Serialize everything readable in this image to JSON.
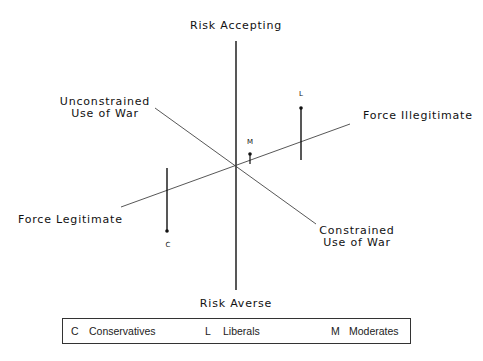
{
  "diagram": {
    "axes": {
      "vertical": {
        "top_label": "Risk Accepting",
        "bottom_label": "Risk Averse"
      },
      "diagonal_shallow": {
        "left_label": "Force Legitimate",
        "right_label": "Force Illegitimate"
      },
      "diagonal_steep": {
        "left_label_line1": "Unconstrained",
        "left_label_line2": "Use of War",
        "right_label_line1": "Constrained",
        "right_label_line2": "Use of War"
      }
    },
    "points": [
      {
        "code": "C",
        "name": "Conservatives"
      },
      {
        "code": "L",
        "name": "Liberals"
      },
      {
        "code": "M",
        "name": "Moderates"
      }
    ]
  },
  "legend": {
    "items": [
      {
        "code": "C",
        "label": "Conservatives"
      },
      {
        "code": "L",
        "label": "Liberals"
      },
      {
        "code": "M",
        "label": "Moderates"
      }
    ]
  },
  "colors": {
    "line": "#111111",
    "thin_line": "#444444",
    "background": "#ffffff"
  }
}
